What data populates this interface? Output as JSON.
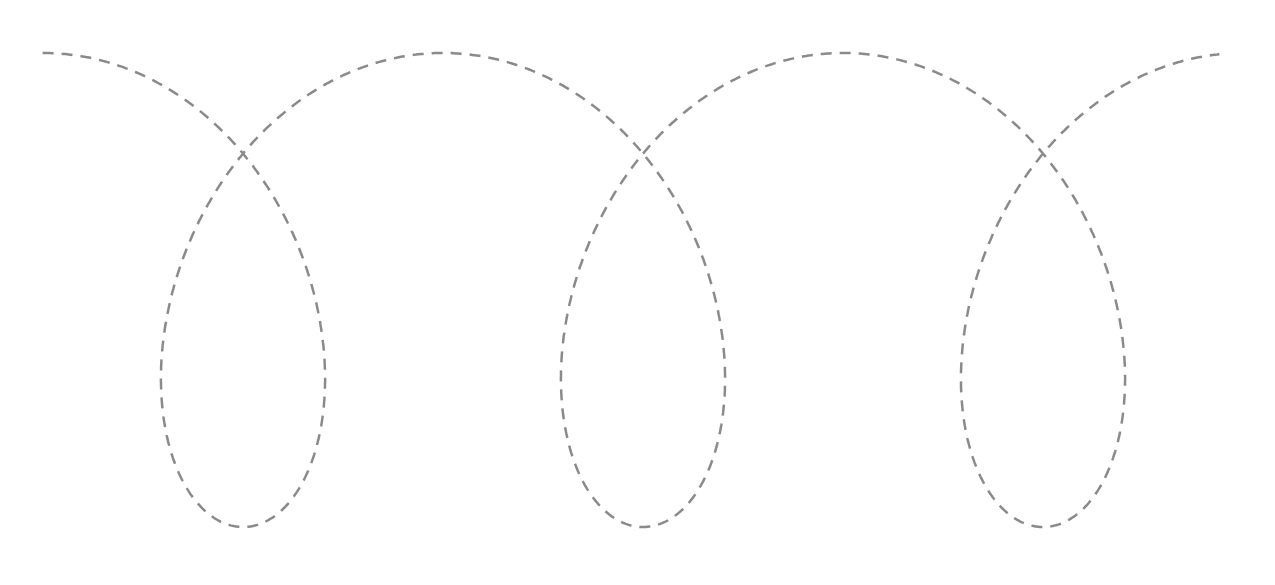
{
  "diagram": {
    "type": "trochoid-curve",
    "stroke_color": "#8a8a8a",
    "stroke_width": 2.5,
    "dash": "11 8",
    "loops": 3,
    "params": {
      "x_start": 42,
      "x_end": 1220,
      "period": 400,
      "loop_centers_x": [
        243,
        645,
        1043
      ],
      "center_y": 290,
      "radius_y": 237,
      "radius_x": 170
    }
  }
}
